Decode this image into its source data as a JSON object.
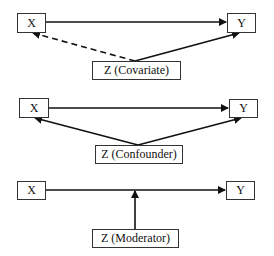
{
  "diagrams": [
    {
      "name": "covariate",
      "x_label": "X",
      "y_label": "Y",
      "z_label": "Z (Covariate)",
      "edges": [
        {
          "from": "X",
          "to": "Y",
          "style": "solid"
        },
        {
          "from": "Z",
          "to": "X",
          "style": "dashed"
        },
        {
          "from": "Z",
          "to": "Y",
          "style": "solid"
        }
      ]
    },
    {
      "name": "confounder",
      "x_label": "X",
      "y_label": "Y",
      "z_label": "Z (Confounder)",
      "edges": [
        {
          "from": "X",
          "to": "Y",
          "style": "solid"
        },
        {
          "from": "Z",
          "to": "X",
          "style": "solid"
        },
        {
          "from": "Z",
          "to": "Y",
          "style": "solid"
        }
      ]
    },
    {
      "name": "moderator",
      "x_label": "X",
      "y_label": "Y",
      "z_label": "Z (Moderator)",
      "edges": [
        {
          "from": "X",
          "to": "Y",
          "style": "solid"
        },
        {
          "from": "Z",
          "to": "X-Y path",
          "style": "solid"
        }
      ]
    }
  ],
  "colors": {
    "line": "#111111",
    "box_border": "#333333",
    "background": "#ffffff"
  }
}
